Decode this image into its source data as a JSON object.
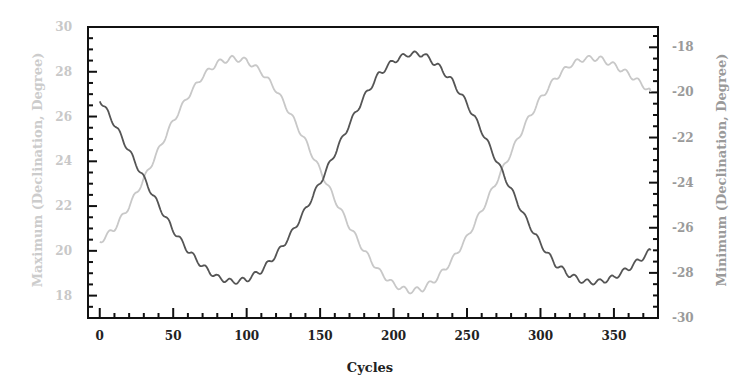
{
  "chart_data": {
    "type": "line",
    "title": "",
    "xlabel": "Cycles",
    "ylabel_left": "Maximum (Declination, Degree)",
    "ylabel_right": "Minimum (Declination, Degree)",
    "xlim": [
      -8,
      380
    ],
    "ylim_left": [
      17,
      30
    ],
    "ylim_right": [
      -30,
      -17.1
    ],
    "x_ticks": [
      0,
      50,
      100,
      150,
      200,
      250,
      300,
      350
    ],
    "y_ticks_left": [
      18,
      20,
      22,
      24,
      26,
      28,
      30
    ],
    "y_ticks_right": [
      -30,
      -28,
      -26,
      -24,
      -22,
      -20,
      -18
    ],
    "grid": false,
    "legend": null,
    "series": [
      {
        "name": "Maximum (Declination, Degree)",
        "axis": "left",
        "color": "#c8c8c8",
        "x": [
          0,
          10,
          20,
          30,
          40,
          50,
          60,
          70,
          80,
          90,
          100,
          110,
          120,
          130,
          140,
          150,
          160,
          170,
          180,
          190,
          200,
          210,
          220,
          230,
          240,
          250,
          260,
          270,
          280,
          290,
          300,
          310,
          320,
          330,
          340,
          350,
          360,
          370,
          375
        ],
        "values": [
          20.4,
          21.0,
          22.0,
          23.2,
          24.5,
          25.8,
          26.9,
          27.8,
          28.4,
          28.6,
          28.5,
          28.0,
          27.2,
          26.1,
          24.9,
          23.6,
          22.3,
          21.1,
          20.0,
          19.1,
          18.5,
          18.2,
          18.3,
          18.8,
          19.6,
          20.6,
          21.8,
          23.1,
          24.4,
          25.7,
          26.8,
          27.7,
          28.3,
          28.6,
          28.6,
          28.3,
          27.9,
          27.4,
          27.1
        ]
      },
      {
        "name": "Minimum (Declination, Degree)",
        "axis": "right",
        "color": "#555555",
        "x": [
          0,
          10,
          20,
          30,
          40,
          50,
          60,
          70,
          80,
          90,
          100,
          110,
          120,
          130,
          140,
          150,
          160,
          170,
          180,
          190,
          200,
          210,
          220,
          230,
          240,
          250,
          260,
          270,
          280,
          290,
          300,
          310,
          320,
          330,
          340,
          350,
          360,
          370,
          375
        ],
        "values": [
          -20.3,
          -21.4,
          -22.6,
          -23.8,
          -25.0,
          -26.1,
          -27.0,
          -27.7,
          -28.2,
          -28.4,
          -28.3,
          -27.9,
          -27.2,
          -26.3,
          -25.2,
          -24.0,
          -22.7,
          -21.4,
          -20.2,
          -19.2,
          -18.6,
          -18.3,
          -18.3,
          -18.8,
          -19.5,
          -20.5,
          -21.7,
          -23.0,
          -24.3,
          -25.6,
          -26.7,
          -27.6,
          -28.1,
          -28.4,
          -28.4,
          -28.2,
          -27.8,
          -27.3,
          -27.0
        ]
      }
    ]
  }
}
